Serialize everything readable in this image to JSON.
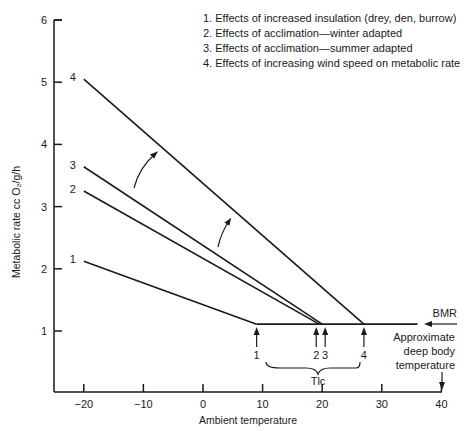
{
  "chart_data": {
    "type": "line",
    "title": "",
    "xlabel": "Ambient temperature",
    "ylabel": "Metabolic rate cc O₂/g/h",
    "xlim": [
      -25,
      40
    ],
    "ylim": [
      0.4,
      6
    ],
    "xticks": [
      -20,
      -10,
      0,
      10,
      20,
      30,
      40
    ],
    "yticks": [
      1,
      2,
      3,
      4,
      5,
      6
    ],
    "grid": false,
    "legend_position": "top-right",
    "legend": [
      "1.  Effects of increased insulation (drey, den, burrow)",
      "2.  Effects of acclimation—winter adapted",
      "3.  Effects of acclimation—summer adapted",
      "4.  Effects of increasing wind speed on metabolic rate"
    ],
    "bmr_level": 1.11,
    "bmr_line": {
      "x": [
        9,
        36
      ],
      "y": [
        1.11,
        1.11
      ]
    },
    "series": [
      {
        "name": "1",
        "x": [
          -20,
          9
        ],
        "y": [
          2.12,
          1.11
        ]
      },
      {
        "name": "2",
        "x": [
          -20,
          19.5
        ],
        "y": [
          3.25,
          1.11
        ]
      },
      {
        "name": "3",
        "x": [
          -20,
          20
        ],
        "y": [
          3.64,
          1.11
        ]
      },
      {
        "name": "4",
        "x": [
          -20,
          27
        ],
        "y": [
          5.05,
          1.11
        ]
      }
    ],
    "lower_critical_temps": [
      {
        "label": "1",
        "x": 9
      },
      {
        "label": "2",
        "x": 19
      },
      {
        "label": "3",
        "x": 20.5
      },
      {
        "label": "4",
        "x": 27
      }
    ],
    "annotations": {
      "bmr": "BMR",
      "deep_body_temp": [
        "Approximate",
        "deep body",
        "temperature"
      ],
      "deep_body_temp_x": 40,
      "tlc": "Tlc",
      "tlc_range": [
        9,
        27
      ]
    }
  }
}
